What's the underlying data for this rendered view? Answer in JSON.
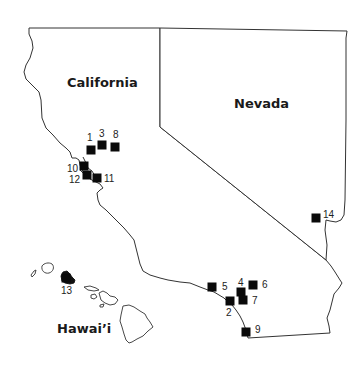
{
  "map": {
    "regions": [
      {
        "id": "california",
        "label": "California",
        "label_x": 67,
        "label_y": 87
      },
      {
        "id": "nevada",
        "label": "Nevada",
        "label_x": 234,
        "label_y": 108
      },
      {
        "id": "hawaii",
        "label": "Hawai’i",
        "label_x": 57,
        "label_y": 333
      }
    ],
    "marker_color": "#0a0a0a",
    "sites": [
      {
        "n": "1",
        "x": 91,
        "y": 150,
        "lx": 87,
        "ly": 141
      },
      {
        "n": "2",
        "x": 230,
        "y": 301,
        "lx": 226,
        "ly": 316
      },
      {
        "n": "3",
        "x": 102,
        "y": 145,
        "lx": 99,
        "ly": 137
      },
      {
        "n": "4",
        "x": 241,
        "y": 292,
        "lx": 238,
        "ly": 286
      },
      {
        "n": "5",
        "x": 212,
        "y": 287,
        "lx": 222,
        "ly": 290
      },
      {
        "n": "6",
        "x": 253,
        "y": 285,
        "lx": 262,
        "ly": 288
      },
      {
        "n": "7",
        "x": 243,
        "y": 300,
        "lx": 252,
        "ly": 304
      },
      {
        "n": "8",
        "x": 115,
        "y": 147,
        "lx": 113,
        "ly": 138
      },
      {
        "n": "9",
        "x": 246,
        "y": 332,
        "lx": 255,
        "ly": 333
      },
      {
        "n": "10",
        "x": 84,
        "y": 166,
        "lx": 67,
        "ly": 172
      },
      {
        "n": "11",
        "x": 97,
        "y": 178,
        "lx": 104,
        "ly": 182
      },
      {
        "n": "12",
        "x": 87,
        "y": 175,
        "lx": 69,
        "ly": 183
      },
      {
        "n": "13",
        "x": 66,
        "y": 278,
        "lx": 61,
        "ly": 294
      },
      {
        "n": "14",
        "x": 316,
        "y": 218,
        "lx": 323,
        "ly": 218
      }
    ]
  }
}
